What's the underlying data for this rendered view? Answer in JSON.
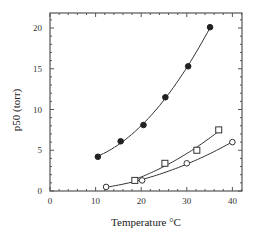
{
  "chart_data": {
    "type": "scatter",
    "title": "",
    "xlabel": "Temperature °C",
    "ylabel": "p50 (torr)",
    "xlim": [
      0,
      42
    ],
    "ylim": [
      0,
      22
    ],
    "xticks": [
      0,
      10,
      20,
      30,
      40
    ],
    "yticks": [
      0,
      5,
      10,
      15,
      20
    ],
    "grid": false,
    "legend": null,
    "series": [
      {
        "name": "filled-circles",
        "marker": "filled-circle",
        "x": [
          10.5,
          15.5,
          20.5,
          25.3,
          30.3,
          35.1
        ],
        "y": [
          4.2,
          6.1,
          8.1,
          11.5,
          15.3,
          20.1
        ]
      },
      {
        "name": "open-squares",
        "marker": "open-square",
        "x": [
          18.6,
          25.2,
          32.2,
          37.0
        ],
        "y": [
          1.3,
          3.4,
          5.0,
          7.5
        ]
      },
      {
        "name": "open-circles",
        "marker": "open-circle",
        "x": [
          12.3,
          20.2,
          30.0,
          40.0
        ],
        "y": [
          0.5,
          1.3,
          3.4,
          6.0
        ]
      }
    ]
  }
}
